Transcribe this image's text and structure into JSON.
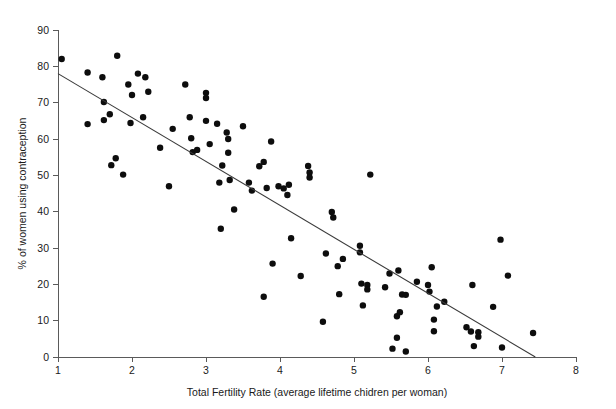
{
  "chart_data": {
    "type": "scatter",
    "title": "",
    "xlabel": "Total Fertility Rate (average lifetime chidren per woman)",
    "ylabel": "% of women using contraception",
    "xlim": [
      1,
      8
    ],
    "ylim": [
      0,
      90
    ],
    "xticks": [
      1,
      2,
      3,
      4,
      5,
      6,
      7,
      8
    ],
    "yticks": [
      0,
      10,
      20,
      30,
      40,
      50,
      60,
      70,
      80,
      90
    ],
    "xtick_labels": [
      "1",
      "2",
      "3",
      "4",
      "5",
      "6",
      "7",
      "8"
    ],
    "ytick_labels": [
      "0",
      "10",
      "20",
      "30",
      "40",
      "50",
      "60",
      "70",
      "80",
      "90"
    ],
    "grid": false,
    "legend": null,
    "marker": {
      "shape": "circle",
      "color": "#0d0d0d",
      "size": 3.2
    },
    "trend_line": {
      "label": "linear regression fit",
      "color": "#3a3a3a",
      "x_start": 1.0,
      "y_start": 78.0,
      "x_end": 7.45,
      "y_end": 0.0,
      "slope": -12.1,
      "intercept": 90.1
    },
    "points": [
      [
        1.05,
        82.0
      ],
      [
        1.4,
        78.3
      ],
      [
        1.4,
        64.1
      ],
      [
        1.6,
        77.0
      ],
      [
        1.62,
        70.2
      ],
      [
        1.62,
        65.2
      ],
      [
        1.7,
        66.8
      ],
      [
        1.72,
        52.8
      ],
      [
        1.78,
        54.7
      ],
      [
        1.8,
        82.9
      ],
      [
        1.88,
        50.2
      ],
      [
        1.95,
        75.0
      ],
      [
        1.98,
        64.4
      ],
      [
        2.0,
        72.1
      ],
      [
        2.08,
        78.0
      ],
      [
        2.18,
        77.0
      ],
      [
        2.15,
        66.0
      ],
      [
        2.22,
        73.0
      ],
      [
        2.38,
        57.6
      ],
      [
        2.5,
        47.0
      ],
      [
        2.55,
        62.8
      ],
      [
        2.72,
        75.0
      ],
      [
        2.78,
        66.0
      ],
      [
        2.8,
        60.2
      ],
      [
        2.82,
        56.4
      ],
      [
        2.88,
        57.0
      ],
      [
        3.0,
        72.7
      ],
      [
        3.0,
        71.3
      ],
      [
        3.0,
        65.0
      ],
      [
        3.05,
        58.6
      ],
      [
        3.15,
        64.2
      ],
      [
        3.18,
        48.0
      ],
      [
        3.2,
        35.3
      ],
      [
        3.22,
        52.7
      ],
      [
        3.28,
        61.8
      ],
      [
        3.3,
        60.0
      ],
      [
        3.3,
        56.2
      ],
      [
        3.32,
        48.7
      ],
      [
        3.38,
        40.6
      ],
      [
        3.5,
        63.5
      ],
      [
        3.58,
        48.0
      ],
      [
        3.62,
        45.8
      ],
      [
        3.72,
        52.5
      ],
      [
        3.78,
        53.7
      ],
      [
        3.78,
        16.6
      ],
      [
        3.82,
        46.5
      ],
      [
        3.88,
        59.3
      ],
      [
        3.9,
        25.7
      ],
      [
        3.98,
        47.0
      ],
      [
        4.05,
        46.4
      ],
      [
        4.1,
        44.6
      ],
      [
        4.12,
        47.4
      ],
      [
        4.15,
        32.7
      ],
      [
        4.28,
        22.3
      ],
      [
        4.38,
        52.6
      ],
      [
        4.4,
        50.8
      ],
      [
        4.4,
        49.4
      ],
      [
        4.58,
        9.7
      ],
      [
        4.62,
        28.5
      ],
      [
        4.7,
        39.9
      ],
      [
        4.72,
        38.4
      ],
      [
        4.78,
        25.0
      ],
      [
        4.8,
        17.3
      ],
      [
        4.85,
        27.0
      ],
      [
        5.08,
        30.6
      ],
      [
        5.08,
        28.8
      ],
      [
        5.1,
        20.2
      ],
      [
        5.12,
        14.2
      ],
      [
        5.18,
        19.8
      ],
      [
        5.18,
        18.6
      ],
      [
        5.22,
        50.2
      ],
      [
        5.42,
        19.2
      ],
      [
        5.48,
        23.0
      ],
      [
        5.52,
        2.3
      ],
      [
        5.58,
        11.2
      ],
      [
        5.58,
        5.3
      ],
      [
        5.6,
        23.8
      ],
      [
        5.62,
        12.3
      ],
      [
        5.65,
        17.2
      ],
      [
        5.7,
        17.1
      ],
      [
        5.7,
        1.5
      ],
      [
        5.85,
        20.7
      ],
      [
        6.0,
        19.8
      ],
      [
        6.02,
        18.0
      ],
      [
        6.05,
        24.7
      ],
      [
        6.08,
        10.3
      ],
      [
        6.08,
        7.1
      ],
      [
        6.12,
        13.9
      ],
      [
        6.22,
        15.2
      ],
      [
        6.52,
        8.2
      ],
      [
        6.58,
        7.0
      ],
      [
        6.6,
        19.8
      ],
      [
        6.62,
        3.0
      ],
      [
        6.68,
        6.8
      ],
      [
        6.68,
        5.6
      ],
      [
        6.88,
        13.8
      ],
      [
        6.98,
        32.3
      ],
      [
        7.0,
        2.6
      ],
      [
        7.08,
        22.4
      ],
      [
        7.42,
        6.6
      ]
    ]
  }
}
